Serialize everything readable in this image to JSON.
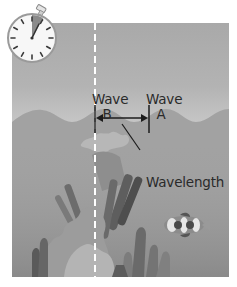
{
  "diagram": {
    "title": "",
    "labels": {
      "wave_b_line1": "Wave",
      "wave_b_line2": "B",
      "wave_a_line1": "Wave",
      "wave_a_line2": "A",
      "wavelength": "Wavelength"
    },
    "elements": {
      "stopwatch": "stopwatch-icon",
      "reference_line": "dashed vertical reference line",
      "arrow": "double-headed arrow spanning one wavelength between crest B and crest A",
      "water_surface": "sinusoidal wave crests",
      "coral": "coral reef",
      "fish": "clownfish"
    },
    "colors": {
      "sky": "#b3b3b3",
      "water": "#9a9a9a",
      "text": "#2a2a2a",
      "dashed_line": "#ffffff",
      "stopwatch_wedge": "#8a8a8a"
    }
  }
}
